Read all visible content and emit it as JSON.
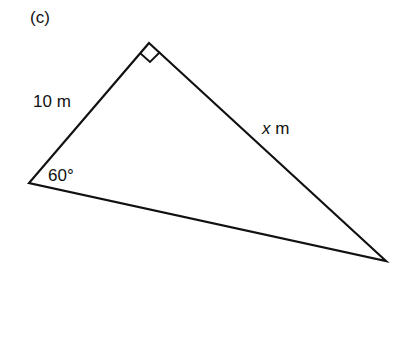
{
  "figure": {
    "part_label": "(c)",
    "side_label": "10 m",
    "hyp_var": "x",
    "hyp_unit": " m",
    "angle_label": "60°"
  },
  "geometry": {
    "vertices": {
      "top": [
        149,
        43
      ],
      "left": [
        29,
        183
      ],
      "right": [
        386,
        261
      ]
    },
    "right_angle_at": "top",
    "stroke_color": "#111111"
  }
}
